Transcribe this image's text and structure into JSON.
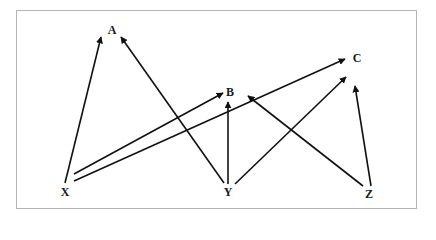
{
  "diagram": {
    "type": "directed-graph",
    "nodes": [
      {
        "id": "A",
        "label": "A",
        "x": 112,
        "y": 30
      },
      {
        "id": "B",
        "label": "B",
        "x": 230,
        "y": 92
      },
      {
        "id": "C",
        "label": "C",
        "x": 357,
        "y": 58
      },
      {
        "id": "X",
        "label": "X",
        "x": 65,
        "y": 192
      },
      {
        "id": "Y",
        "label": "Y",
        "x": 228,
        "y": 192
      },
      {
        "id": "Z",
        "label": "Z",
        "x": 369,
        "y": 194
      }
    ],
    "edges": [
      {
        "from": "X",
        "to": "A"
      },
      {
        "from": "X",
        "to": "B"
      },
      {
        "from": "X",
        "to": "C"
      },
      {
        "from": "Y",
        "to": "A"
      },
      {
        "from": "Y",
        "to": "B"
      },
      {
        "from": "Y",
        "to": "C"
      },
      {
        "from": "Z",
        "to": "B"
      },
      {
        "from": "Z",
        "to": "C"
      }
    ],
    "colors": {
      "line": "#111111",
      "border": "#b4b4b4",
      "background": "#ffffff"
    }
  }
}
